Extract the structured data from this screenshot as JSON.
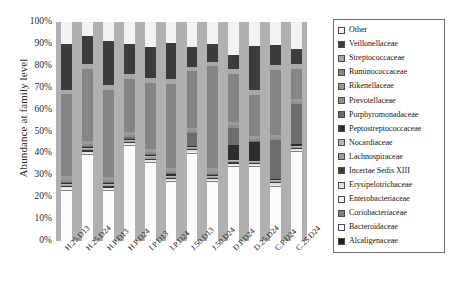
{
  "chart_data": {
    "type": "bar",
    "stacked": true,
    "title": "",
    "xlabel": "",
    "ylabel": "Abundance at family level",
    "ylim": [
      0,
      100
    ],
    "ytick_labels": [
      "100%",
      "90%",
      "80%",
      "70%",
      "60%",
      "50%",
      "40%",
      "30%",
      "20%",
      "10%",
      "0%"
    ],
    "ytick_values": [
      100,
      90,
      80,
      70,
      60,
      50,
      40,
      30,
      20,
      10,
      0
    ],
    "grid": false,
    "legend_position": "right",
    "plot_background": "#b0b0b0",
    "categories": [
      "H.25.D13",
      "H.25.D24",
      "H.P.D13",
      "H.P.D24",
      "I.P.D13",
      "I.P.D24",
      "J.50.D13",
      "J.50.D24",
      "D.P.D24",
      "D.25.D24",
      "C.P.D24",
      "C.25.D24"
    ],
    "series": [
      {
        "name": "Other",
        "color": "#f2f2f2",
        "values": [
          10.0,
          6.5,
          8.5,
          10.0,
          11.5,
          9.5,
          11.5,
          10.0,
          15.0,
          11.0,
          10.5,
          12.5
        ]
      },
      {
        "name": "Veillonellaceae",
        "color": "#3c3c3c",
        "values": [
          21.0,
          13.0,
          20.5,
          14.0,
          14.5,
          16.5,
          9.0,
          8.5,
          6.5,
          20.5,
          9.5,
          7.0
        ]
      },
      {
        "name": "Streptococcaceae",
        "color": "#a8a8a8",
        "values": [
          2.0,
          2.0,
          2.0,
          2.0,
          2.0,
          2.5,
          2.0,
          2.0,
          2.5,
          2.0,
          2.0,
          2.0
        ]
      },
      {
        "name": "Ruminococcaceae",
        "color": "#858585",
        "values": [
          37.5,
          33.0,
          40.0,
          24.5,
          30.5,
          38.5,
          26.0,
          47.0,
          22.0,
          19.0,
          30.0,
          14.0
        ]
      },
      {
        "name": "Rikenellaceae",
        "color": "#9a9a9a",
        "values": [
          1.5,
          1.5,
          1.5,
          1.5,
          1.5,
          1.5,
          1.5,
          1.5,
          1.5,
          1.5,
          1.5,
          1.5
        ]
      },
      {
        "name": "Prevotellaceae",
        "color": "#8e8e8e",
        "values": [
          1.0,
          1.0,
          1.0,
          1.0,
          1.0,
          1.0,
          1.0,
          1.0,
          1.0,
          1.0,
          1.0,
          1.0
        ]
      },
      {
        "name": "Porphyromonadaceae",
        "color": "#6d6d6d",
        "values": [
          0.5,
          0.5,
          0.5,
          0.5,
          0.5,
          0.5,
          6.0,
          0.5,
          8.0,
          0.5,
          18.0,
          18.5
        ]
      },
      {
        "name": "Peptostreptococcaceae",
        "color": "#2e2e2e",
        "values": [
          0.5,
          0.5,
          0.5,
          0.5,
          0.5,
          0.5,
          0.5,
          0.5,
          7.0,
          8.5,
          0.5,
          0.5
        ]
      },
      {
        "name": "Nocardiaceae",
        "color": "#b4b4b4",
        "values": [
          0.5,
          0.5,
          0.5,
          0.5,
          0.5,
          0.5,
          0.5,
          0.5,
          0.5,
          0.5,
          0.5,
          0.5
        ]
      },
      {
        "name": "Lachnospiraceae",
        "color": "#9e9e9e",
        "values": [
          0.5,
          0.5,
          0.5,
          0.5,
          0.5,
          0.5,
          0.5,
          0.5,
          0.5,
          0.5,
          0.5,
          0.5
        ]
      },
      {
        "name": "Incertae Sedis XIII",
        "color": "#3a3a3a",
        "values": [
          0.5,
          0.5,
          0.5,
          0.5,
          0.5,
          0.5,
          0.5,
          0.5,
          0.5,
          0.5,
          0.5,
          0.5
        ]
      },
      {
        "name": "Erysipelotrichaceae",
        "color": "#e0e0e0",
        "values": [
          0.5,
          0.5,
          0.5,
          0.5,
          0.5,
          0.5,
          0.5,
          0.5,
          0.5,
          0.5,
          0.5,
          0.5
        ]
      },
      {
        "name": "Enterobacteriaceae",
        "color": "#efefef",
        "values": [
          0.5,
          0.5,
          0.5,
          0.5,
          0.5,
          0.5,
          0.5,
          0.5,
          0.5,
          0.5,
          0.5,
          0.5
        ]
      },
      {
        "name": "Coriobacteriaceae",
        "color": "#7e7e7e",
        "values": [
          0.5,
          0.5,
          0.5,
          0.5,
          0.5,
          0.5,
          0.5,
          0.5,
          0.5,
          0.5,
          0.5,
          0.5
        ]
      },
      {
        "name": "Bacteroidaceae",
        "color": "#fbfbfb",
        "values": [
          23.0,
          39.5,
          23.0,
          43.5,
          36.0,
          27.0,
          40.0,
          27.0,
          34.0,
          34.0,
          25.0,
          41.0
        ]
      }
    ],
    "extra_legend_entries": [
      {
        "name": "Alcaligenaceae",
        "color": "#1c1c1c"
      }
    ]
  },
  "legend": {
    "items": [
      {
        "label": "Other",
        "color": "#f2f2f2"
      },
      {
        "label": "Veillonellaceae",
        "color": "#3c3c3c"
      },
      {
        "label": "Streptococcaceae",
        "color": "#a8a8a8"
      },
      {
        "label": "Ruminococcaceae",
        "color": "#858585"
      },
      {
        "label": "Rikenellaceae",
        "color": "#9a9a9a"
      },
      {
        "label": "Prevotellaceae",
        "color": "#8e8e8e"
      },
      {
        "label": "Porphyromonadaceae",
        "color": "#6d6d6d"
      },
      {
        "label": "Peptostreptococcaceae",
        "color": "#2e2e2e"
      },
      {
        "label": "Nocardiaceae",
        "color": "#b4b4b4"
      },
      {
        "label": "Lachnospiraceae",
        "color": "#9e9e9e"
      },
      {
        "label": "Incertae Sedis XIII",
        "color": "#3a3a3a"
      },
      {
        "label": "Erysipelotrichaceae",
        "color": "#e0e0e0"
      },
      {
        "label": "Enterobacteriaceae",
        "color": "#efefef"
      },
      {
        "label": "Coriobacteriaceae",
        "color": "#7e7e7e"
      },
      {
        "label": "Bacteroidaceae",
        "color": "#fbfbfb"
      },
      {
        "label": "Alcaligenaceae",
        "color": "#1c1c1c"
      }
    ]
  }
}
